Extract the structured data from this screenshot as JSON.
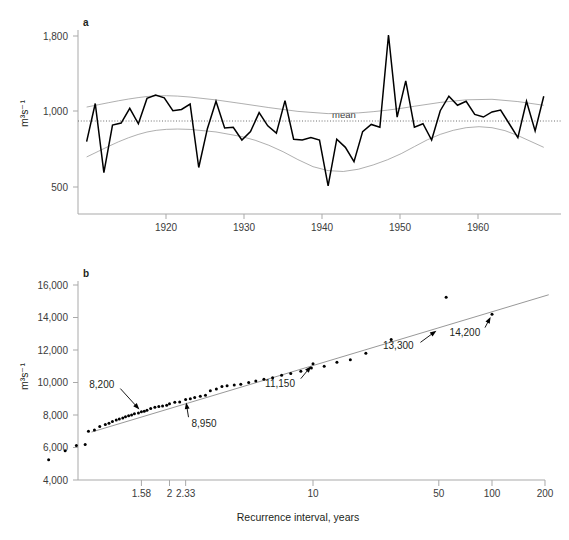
{
  "figure": {
    "background_color": "#ffffff",
    "panel_letters": {
      "top": "a",
      "bottom": "b"
    }
  },
  "chart_data": [
    {
      "type": "line",
      "panel": "a",
      "title": "",
      "xlabel": "",
      "ylabel": "m³s⁻¹",
      "xlim": [
        1912,
        1968
      ],
      "ylim": [
        330,
        1900
      ],
      "yscale": "log",
      "grid": false,
      "legend_position": "none",
      "xticks": [
        1920,
        1930,
        1940,
        1950,
        1960
      ],
      "xtick_labels": [
        "1920",
        "1930",
        "1940",
        "1950",
        "1960"
      ],
      "yticks": [
        500,
        1000,
        1800
      ],
      "ytick_labels": [
        "500",
        "1,000",
        "1,800"
      ],
      "annotations": [
        {
          "text": "mean",
          "x": 1942.5,
          "y": 900
        }
      ],
      "series": [
        {
          "name": "annual discharge",
          "x": [
            1913,
            1914,
            1915,
            1916,
            1917,
            1918,
            1919,
            1920,
            1921,
            1922,
            1923,
            1924,
            1925,
            1926,
            1927,
            1928,
            1929,
            1930,
            1931,
            1932,
            1933,
            1934,
            1935,
            1936,
            1937,
            1938,
            1939,
            1940,
            1941,
            1942,
            1943,
            1944,
            1945,
            1946,
            1947,
            1948,
            1949,
            1950,
            1951,
            1952,
            1953,
            1954,
            1955,
            1956,
            1957,
            1958,
            1959,
            1960,
            1961,
            1962,
            1963,
            1964,
            1965,
            1966
          ],
          "values": [
            735,
            1015,
            565,
            845,
            860,
            975,
            855,
            1060,
            1090,
            1065,
            955,
            965,
            1010,
            590,
            820,
            1035,
            825,
            830,
            745,
            800,
            940,
            840,
            790,
            1040,
            750,
            745,
            760,
            745,
            505,
            750,
            700,
            620,
            800,
            850,
            830,
            1815,
            905,
            1230,
            830,
            855,
            745,
            955,
            1080,
            1000,
            1035,
            925,
            905,
            945,
            960,
            855,
            760,
            1035,
            805,
            1080
          ]
        },
        {
          "name": "upper envelope",
          "x": [
            1913,
            1918,
            1922,
            1928,
            1934,
            1941,
            1948,
            1954,
            1960,
            1966
          ],
          "values": [
            985,
            1060,
            1095,
            1050,
            980,
            920,
            955,
            1030,
            1065,
            1000
          ]
        },
        {
          "name": "lower envelope",
          "x": [
            1913,
            1918,
            1922,
            1928,
            1934,
            1941,
            1948,
            1954,
            1960,
            1966
          ],
          "values": [
            645,
            770,
            825,
            805,
            730,
            545,
            620,
            800,
            855,
            700
          ]
        },
        {
          "name": "mean",
          "x": [
            1912,
            1968
          ],
          "values": [
            900,
            900
          ]
        }
      ]
    },
    {
      "type": "scatter",
      "panel": "b",
      "title": "",
      "xlabel": "Recurrence interval, years",
      "ylabel": "m³s⁻¹",
      "xscale": "gumbel-log",
      "xlim": [
        1.02,
        230
      ],
      "ylim": [
        4000,
        16000
      ],
      "grid": false,
      "legend_position": "none",
      "xticks": [
        1.58,
        2,
        2.33,
        10,
        50,
        100,
        200
      ],
      "xtick_labels": [
        "1.58",
        "2",
        "2.33",
        "10",
        "50",
        "100",
        "200"
      ],
      "yticks": [
        4000,
        6000,
        8000,
        10000,
        12000,
        14000,
        16000
      ],
      "ytick_labels": [
        "4,000",
        "6,000",
        "8,000",
        "10,000",
        "12,000",
        "14,000",
        "16,000"
      ],
      "annotations": [
        {
          "text": "8,200",
          "x": 1.58,
          "y": 8200,
          "label_x": 1.33,
          "label_y": 9900
        },
        {
          "text": "8,950",
          "x": 2.33,
          "y": 8950,
          "label_x": 2.42,
          "label_y": 7500
        },
        {
          "text": "11,150",
          "x": 10,
          "y": 11150,
          "label_x": 8.2,
          "label_y": 9950
        },
        {
          "text": "13,300",
          "x": 50,
          "y": 13300,
          "label_x": 37,
          "label_y": 12250
        },
        {
          "text": "14,200",
          "x": 100,
          "y": 14200,
          "label_x": 88,
          "label_y": 13050
        }
      ],
      "fit_line": {
        "name": "Gumbel fit",
        "x": [
          1.17,
          210
        ],
        "values": [
          6950,
          15400
        ]
      },
      "points": {
        "name": "ranked annual maxima",
        "x": [
          1.035,
          1.07,
          1.105,
          1.14,
          1.155,
          1.185,
          1.215,
          1.25,
          1.275,
          1.3,
          1.33,
          1.355,
          1.385,
          1.41,
          1.44,
          1.47,
          1.5,
          1.545,
          1.58,
          1.615,
          1.65,
          1.7,
          1.76,
          1.82,
          1.88,
          1.95,
          2.0,
          2.1,
          2.2,
          2.33,
          2.44,
          2.55,
          2.7,
          2.85,
          3.0,
          3.2,
          3.4,
          3.6,
          3.9,
          4.2,
          4.6,
          5.0,
          5.5,
          6.1,
          6.8,
          7.6,
          8.6,
          9.8,
          10.0,
          11.5,
          13.5,
          16.0,
          19.5,
          27.0,
          55.0,
          100.0
        ],
        "values": [
          5250,
          5800,
          6120,
          6180,
          7000,
          7080,
          7300,
          7420,
          7500,
          7600,
          7700,
          7760,
          7820,
          7900,
          7950,
          8000,
          8080,
          8120,
          8200,
          8230,
          8300,
          8400,
          8480,
          8520,
          8560,
          8600,
          8700,
          8780,
          8800,
          8950,
          9000,
          9080,
          9150,
          9220,
          9500,
          9600,
          9750,
          9800,
          9850,
          9900,
          10000,
          10100,
          10200,
          10300,
          10450,
          10550,
          10700,
          10900,
          11150,
          11000,
          11250,
          11400,
          11800,
          12650,
          15250,
          14200
        ]
      }
    }
  ]
}
